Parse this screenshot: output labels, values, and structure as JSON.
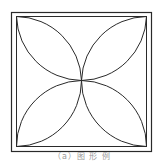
{
  "figure": {
    "outer_square": {
      "x": 11,
      "y": 12,
      "size": 140
    },
    "inner_square": {
      "x": 16,
      "y": 16,
      "size": 131
    },
    "center": {
      "x": 81,
      "y": 80
    },
    "stroke_color": "#2a2a2a",
    "petal_count": 4
  },
  "caption": {
    "text": "（a）图 形 例"
  }
}
